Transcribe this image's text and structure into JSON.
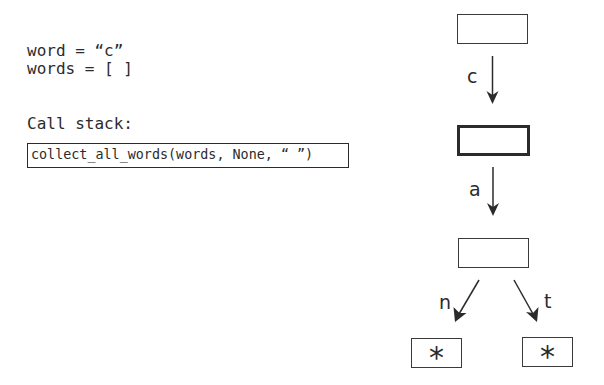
{
  "variables": {
    "word_line": "word = “c”",
    "words_line": "words = [ ]"
  },
  "call_stack": {
    "label": "Call stack:",
    "frames": [
      {
        "text": "collect_all_words(words, None, “ ”)"
      }
    ]
  },
  "trie": {
    "nodes": [
      {
        "id": "root",
        "label": "",
        "current": false
      },
      {
        "id": "c",
        "label": "",
        "current": true
      },
      {
        "id": "ca",
        "label": "",
        "current": false
      },
      {
        "id": "can_end",
        "label": "*",
        "current": false
      },
      {
        "id": "cat_end",
        "label": "*",
        "current": false
      }
    ],
    "edges": [
      {
        "from": "root",
        "to": "c",
        "label": "c"
      },
      {
        "from": "c",
        "to": "ca",
        "label": "a"
      },
      {
        "from": "ca",
        "to": "can_end",
        "label": "n"
      },
      {
        "from": "ca",
        "to": "cat_end",
        "label": "t"
      }
    ]
  }
}
